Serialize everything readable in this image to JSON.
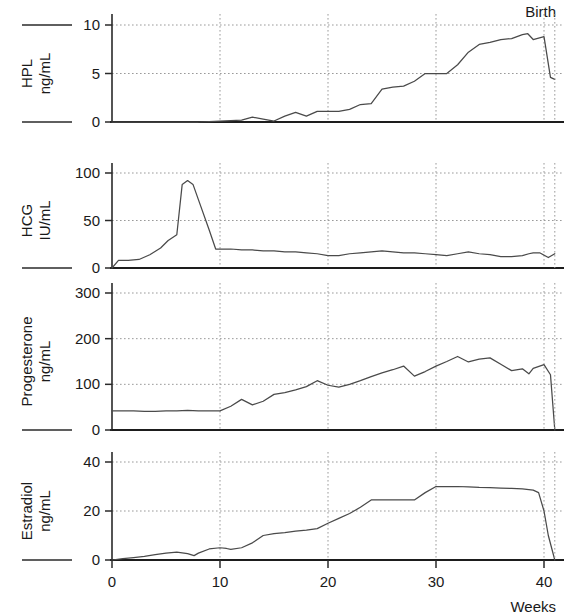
{
  "figure": {
    "annotation_birth": "Birth",
    "x_axis_unit_label": "Weeks",
    "x_tick_labels": [
      "0",
      "10",
      "20",
      "30",
      "40"
    ],
    "line_color": "#4a4a4a",
    "grid_color": "#9a9a9a",
    "axis_color": "#1d1d1d"
  },
  "chart_data": [
    {
      "type": "line",
      "title": "",
      "panel": "HPL",
      "ylabel": "HPL\nng/mL",
      "ylabel_line1": "HPL",
      "ylabel_line2": "ng/mL",
      "xlabel": "Weeks",
      "units": "ng/mL",
      "xlim": [
        0,
        41
      ],
      "ylim": [
        0,
        10
      ],
      "yticks": [
        0,
        5,
        10
      ],
      "ytick_labels": [
        "0",
        "5",
        "10"
      ],
      "grid": true,
      "annotations": [
        {
          "text": "Birth",
          "x": 41,
          "y": 10
        }
      ],
      "x": [
        0,
        1,
        2,
        3,
        4,
        5,
        6,
        7,
        8,
        9,
        10,
        11,
        12,
        13,
        14,
        15,
        16,
        17,
        18,
        19,
        20,
        21,
        22,
        23,
        24,
        25,
        26,
        27,
        28,
        29,
        30,
        31,
        32,
        33,
        34,
        35,
        36,
        37,
        38,
        38.5,
        39,
        40,
        40.6,
        41
      ],
      "values": [
        0,
        0,
        0,
        0,
        0,
        0,
        0,
        0,
        0,
        0.05,
        0.1,
        0.15,
        0.2,
        0.5,
        0.3,
        0.1,
        0.6,
        1.0,
        0.6,
        1.1,
        1.1,
        1.1,
        1.3,
        1.8,
        1.9,
        3.4,
        3.6,
        3.7,
        4.2,
        5.0,
        5.0,
        5.0,
        5.9,
        7.2,
        8.0,
        8.2,
        8.5,
        8.6,
        9.0,
        9.1,
        8.5,
        8.8,
        4.6,
        4.4
      ]
    },
    {
      "type": "line",
      "title": "",
      "panel": "HCG",
      "ylabel": "HCG\nIU/mL",
      "ylabel_line1": "HCG",
      "ylabel_line2": "IU/mL",
      "xlabel": "Weeks",
      "units": "IU/mL",
      "xlim": [
        0,
        41
      ],
      "ylim": [
        0,
        120
      ],
      "yticks": [
        0,
        50,
        100
      ],
      "ytick_labels": [
        "0",
        "50",
        "100"
      ],
      "grid": true,
      "x": [
        0,
        0.6,
        1.5,
        2.5,
        3.5,
        4.5,
        5.2,
        6,
        6.5,
        7,
        7.5,
        8,
        9,
        9.6,
        10,
        11,
        12,
        13,
        14,
        15,
        16,
        17,
        18,
        19,
        20,
        21,
        22,
        23,
        24,
        25,
        26,
        27,
        28,
        29,
        30,
        31,
        32,
        33,
        34,
        35,
        36,
        37,
        38,
        38.6,
        39,
        39.6,
        40.4,
        41
      ],
      "values": [
        0,
        8,
        8,
        9,
        14,
        21,
        29,
        35,
        88,
        92,
        88,
        72,
        40,
        20,
        20,
        20,
        19,
        19,
        18,
        18,
        17,
        17,
        16,
        15,
        13,
        13,
        15,
        16,
        17,
        18,
        17,
        16,
        16,
        15,
        14,
        13,
        15,
        17,
        15,
        14,
        12,
        12,
        13,
        15,
        16,
        16,
        11,
        15,
        2
      ]
    },
    {
      "type": "line",
      "title": "",
      "panel": "Progesterone",
      "ylabel": "Progesterone\nng/mL",
      "ylabel_line1": "Progesterone",
      "ylabel_line2": "ng/mL",
      "xlabel": "Weeks",
      "units": "ng/mL",
      "xlim": [
        0,
        41
      ],
      "ylim": [
        0,
        340
      ],
      "yticks": [
        0,
        100,
        200,
        300
      ],
      "ytick_labels": [
        "0",
        "100",
        "200",
        "300"
      ],
      "grid": true,
      "x": [
        0,
        1,
        2,
        3,
        4,
        5,
        6,
        7,
        8,
        9,
        10,
        11,
        12,
        13,
        14,
        15,
        16,
        17,
        18,
        19,
        20,
        21,
        22,
        23,
        24,
        25,
        26,
        27,
        28,
        29,
        30,
        31,
        32,
        33,
        34,
        35,
        36,
        37,
        38,
        38.6,
        39,
        40,
        40.6,
        41
      ],
      "values": [
        42,
        42,
        42,
        41,
        41,
        42,
        42,
        43,
        42,
        42,
        42,
        52,
        67,
        55,
        63,
        78,
        82,
        88,
        95,
        108,
        98,
        94,
        100,
        108,
        117,
        125,
        132,
        140,
        118,
        128,
        140,
        150,
        161,
        149,
        155,
        158,
        144,
        130,
        134,
        123,
        135,
        143,
        121,
        0
      ]
    },
    {
      "type": "line",
      "title": "",
      "panel": "Estradiol",
      "ylabel": "Estradiol\nng/mL",
      "ylabel_line1": "Estradiol",
      "ylabel_line2": "ng/mL",
      "xlabel": "Weeks",
      "units": "ng/mL",
      "xlim": [
        0,
        41
      ],
      "ylim": [
        0,
        50
      ],
      "yticks": [
        0,
        20,
        40
      ],
      "ytick_labels": [
        "0",
        "20",
        "40"
      ],
      "grid": true,
      "x": [
        0,
        1,
        2,
        3,
        4,
        5,
        6,
        7,
        7.6,
        8,
        9,
        10,
        10.6,
        11,
        12,
        13,
        14,
        15,
        16,
        17,
        18,
        19,
        20,
        21,
        22,
        23,
        24,
        25,
        26,
        27,
        28,
        29,
        30,
        31,
        32,
        33,
        34,
        35,
        36,
        37,
        38,
        39,
        39.5,
        40,
        40.4,
        41
      ],
      "values": [
        0,
        0.6,
        1.0,
        1.5,
        2.2,
        2.8,
        3.2,
        2.6,
        1.8,
        2.8,
        4.5,
        5.0,
        4.7,
        4.3,
        5.0,
        7.0,
        10.0,
        10.8,
        11.2,
        11.8,
        12.2,
        12.8,
        15.0,
        17.0,
        19.0,
        21.5,
        24.5,
        24.5,
        24.5,
        24.5,
        24.5,
        27.5,
        30.0,
        30.0,
        30.0,
        29.8,
        29.6,
        29.5,
        29.3,
        29.2,
        29.0,
        28.5,
        27.5,
        20.0,
        10.0,
        0
      ]
    }
  ]
}
